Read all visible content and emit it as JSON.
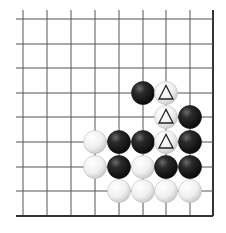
{
  "board": {
    "title": "Go problem diagram (bottom-right corner)",
    "columns": 9,
    "rows": 9,
    "grid": {
      "x": [
        23,
        47,
        71,
        95,
        119,
        143,
        166,
        190,
        213
      ],
      "y": [
        19,
        44,
        68,
        93,
        117,
        142,
        167,
        191,
        216
      ],
      "line_start_x": 16,
      "line_start_y": 10,
      "right_edge_x": 213,
      "bottom_edge_y": 216,
      "line_color": "#555555",
      "edge_color": "#333333"
    },
    "stone_radius": 11.5,
    "colors": {
      "black": "#1a1a1a",
      "white": "#f4f4f4",
      "marker": "#222222"
    },
    "stones": [
      {
        "col": 5,
        "row": 3,
        "color": "black",
        "marker": null
      },
      {
        "col": 6,
        "row": 3,
        "color": "white",
        "marker": "triangle"
      },
      {
        "col": 6,
        "row": 4,
        "color": "white",
        "marker": "triangle"
      },
      {
        "col": 7,
        "row": 4,
        "color": "black",
        "marker": null
      },
      {
        "col": 3,
        "row": 5,
        "color": "white",
        "marker": null
      },
      {
        "col": 4,
        "row": 5,
        "color": "black",
        "marker": null
      },
      {
        "col": 5,
        "row": 5,
        "color": "black",
        "marker": null
      },
      {
        "col": 6,
        "row": 5,
        "color": "white",
        "marker": "triangle"
      },
      {
        "col": 7,
        "row": 5,
        "color": "black",
        "marker": null
      },
      {
        "col": 3,
        "row": 6,
        "color": "white",
        "marker": null
      },
      {
        "col": 4,
        "row": 6,
        "color": "black",
        "marker": null
      },
      {
        "col": 5,
        "row": 6,
        "color": "white",
        "marker": null
      },
      {
        "col": 6,
        "row": 6,
        "color": "black",
        "marker": null
      },
      {
        "col": 7,
        "row": 6,
        "color": "black",
        "marker": null
      },
      {
        "col": 4,
        "row": 7,
        "color": "white",
        "marker": null
      },
      {
        "col": 5,
        "row": 7,
        "color": "white",
        "marker": null
      },
      {
        "col": 6,
        "row": 7,
        "color": "white",
        "marker": null
      },
      {
        "col": 7,
        "row": 7,
        "color": "white",
        "marker": null
      }
    ]
  }
}
